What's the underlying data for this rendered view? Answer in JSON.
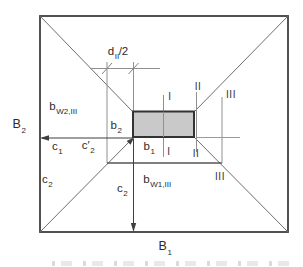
{
  "figure": {
    "type": "technical-diagram",
    "colors": {
      "background": "#ffffff",
      "outline_dark": "#3f3f3f",
      "diagonal_gray": "#6e6e6e",
      "thin_gray": "#909090",
      "column_fill": "#c9c9c9",
      "column_stroke": "#333333",
      "text": "#2b2b2b"
    },
    "labels": {
      "d_half": {
        "base": "d",
        "sub": "II",
        "suffix": "/2"
      },
      "b_w2": {
        "base": "b",
        "sub": "W2,III"
      },
      "B2": {
        "base": "B",
        "sub": "2"
      },
      "b2": {
        "base": "b",
        "sub": "2"
      },
      "c1": {
        "base": "c",
        "sub": "1"
      },
      "c2_prime": {
        "base": "c′",
        "sub": "2"
      },
      "c2_left": {
        "base": "c",
        "sub": "2"
      },
      "b1": {
        "base": "b",
        "sub": "1"
      },
      "c2_bottom": {
        "base": "c",
        "sub": "2"
      },
      "b_w1": {
        "base": "b",
        "sub": "W1,III"
      },
      "B1": {
        "base": "B",
        "sub": "1"
      }
    },
    "sections": {
      "I_top": "I",
      "I_bottom": "I",
      "II_top": "II",
      "II_bottom": "II",
      "III_top": "III",
      "III_bottom": "III"
    }
  }
}
